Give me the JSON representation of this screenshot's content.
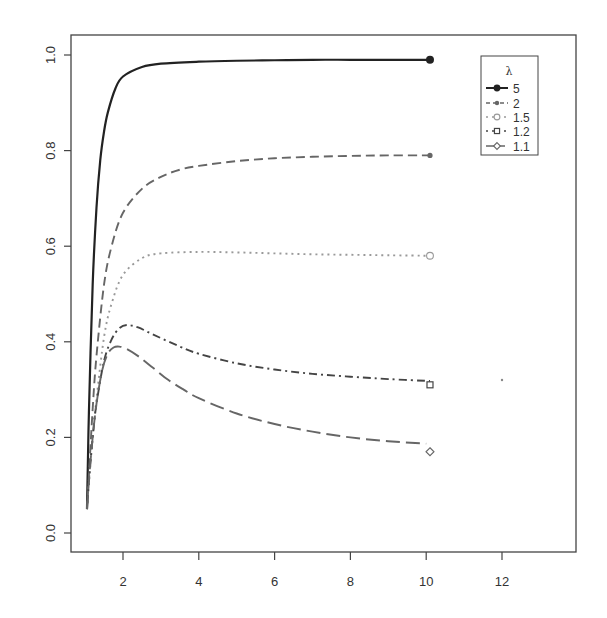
{
  "chart_data": {
    "type": "line",
    "title": "",
    "xlabel": "",
    "ylabel": "",
    "xlim": [
      0.5,
      13.3
    ],
    "ylim": [
      -0.04,
      1.04
    ],
    "x_ticks": [
      2,
      4,
      6,
      8,
      10,
      12
    ],
    "x_tick_labels": [
      "2",
      "4",
      "6",
      "8",
      "10",
      "12"
    ],
    "y_ticks": [
      0.0,
      0.2,
      0.4,
      0.6,
      0.8,
      1.0
    ],
    "y_tick_labels": [
      "0.0",
      "0.2",
      "0.4",
      "0.6",
      "0.8",
      "1.0"
    ],
    "grid": false,
    "legend": {
      "title": "λ",
      "position": "top-right",
      "entries": [
        "5",
        "2",
        "1.5",
        "1.2",
        "1.1"
      ]
    },
    "series": [
      {
        "name": "5",
        "line_style": "solid",
        "color": "#222222",
        "marker": "filled-circle",
        "x": [
          1.05,
          1.1,
          1.2,
          1.3,
          1.4,
          1.5,
          1.6,
          1.8,
          2.0,
          2.5,
          3,
          4,
          5,
          6,
          7,
          8,
          9,
          10.1
        ],
        "y": [
          0.05,
          0.25,
          0.52,
          0.68,
          0.78,
          0.84,
          0.88,
          0.93,
          0.955,
          0.975,
          0.982,
          0.986,
          0.988,
          0.989,
          0.99,
          0.99,
          0.99,
          0.99
        ],
        "end_marker": {
          "x": 10.1,
          "y": 0.99
        }
      },
      {
        "name": "2",
        "line_style": "dashed",
        "color": "#666666",
        "marker": "small-filled-circle",
        "x": [
          1.05,
          1.1,
          1.2,
          1.3,
          1.5,
          1.7,
          2.0,
          2.5,
          3,
          3.5,
          4,
          5,
          6,
          7,
          8,
          9,
          10.1
        ],
        "y": [
          0.05,
          0.12,
          0.26,
          0.37,
          0.52,
          0.6,
          0.67,
          0.72,
          0.745,
          0.76,
          0.768,
          0.778,
          0.784,
          0.787,
          0.789,
          0.79,
          0.79
        ],
        "end_marker": {
          "x": 10.1,
          "y": 0.79
        }
      },
      {
        "name": "1.5",
        "line_style": "dotted",
        "color": "#999999",
        "marker": "open-circle",
        "x": [
          1.05,
          1.1,
          1.2,
          1.3,
          1.5,
          1.7,
          2.0,
          2.5,
          3,
          4,
          5,
          6,
          7,
          8,
          9,
          10.1
        ],
        "y": [
          0.05,
          0.1,
          0.2,
          0.28,
          0.41,
          0.48,
          0.54,
          0.575,
          0.585,
          0.588,
          0.587,
          0.585,
          0.583,
          0.582,
          0.581,
          0.58
        ],
        "end_marker": {
          "x": 10.1,
          "y": 0.58
        }
      },
      {
        "name": "1.2",
        "line_style": "dotdash",
        "color": "#444444",
        "marker": "open-square",
        "x": [
          1.05,
          1.1,
          1.2,
          1.3,
          1.5,
          1.7,
          1.9,
          2.1,
          2.4,
          2.8,
          3.5,
          4,
          5,
          6,
          7,
          8,
          9,
          10.1
        ],
        "y": [
          0.05,
          0.11,
          0.2,
          0.27,
          0.36,
          0.405,
          0.428,
          0.435,
          0.43,
          0.415,
          0.39,
          0.375,
          0.355,
          0.342,
          0.333,
          0.327,
          0.322,
          0.318
        ],
        "end_marker": {
          "x": 10.1,
          "y": 0.31
        }
      },
      {
        "name": "1.1",
        "line_style": "longdash",
        "color": "#666666",
        "marker": "open-diamond",
        "x": [
          1.05,
          1.1,
          1.2,
          1.3,
          1.45,
          1.6,
          1.75,
          1.9,
          2.1,
          2.4,
          2.8,
          3.2,
          3.6,
          4,
          5,
          6,
          7,
          8,
          9,
          10.0
        ],
        "y": [
          0.05,
          0.11,
          0.2,
          0.27,
          0.34,
          0.375,
          0.388,
          0.39,
          0.385,
          0.37,
          0.345,
          0.32,
          0.3,
          0.282,
          0.25,
          0.228,
          0.212,
          0.2,
          0.192,
          0.187
        ],
        "end_marker": {
          "x": 10.1,
          "y": 0.17
        }
      }
    ],
    "annotations": [
      {
        "type": "stray-point",
        "x": 12.0,
        "y": 0.32
      }
    ]
  }
}
